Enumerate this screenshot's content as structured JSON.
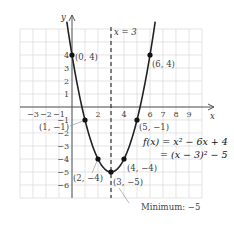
{
  "chart_data": {
    "type": "line",
    "title": "",
    "xlabel": "x",
    "ylabel": "y",
    "xlim": [
      -4,
      10
    ],
    "ylim": [
      -7,
      6
    ],
    "grid": true,
    "x_ticks": [
      -3,
      -2,
      -1,
      2,
      4,
      6,
      7,
      8,
      9
    ],
    "y_ticks": [
      4,
      3,
      2,
      1,
      -1,
      -2,
      -3,
      -4,
      -5,
      -6
    ],
    "series": [
      {
        "name": "f(x) = x^2 - 6x + 4",
        "function": "x^2 - 6x + 4",
        "domain": [
          -0.4,
          6.4
        ]
      }
    ],
    "points": [
      {
        "x": 0,
        "y": 4,
        "label": "(0, 4)"
      },
      {
        "x": 6,
        "y": 4,
        "label": "(6, 4)"
      },
      {
        "x": 1,
        "y": -1,
        "label": "(1, −1)"
      },
      {
        "x": 5,
        "y": -1,
        "label": "(5, −1)"
      },
      {
        "x": 2,
        "y": -4,
        "label": "(2, −4)"
      },
      {
        "x": 4,
        "y": -4,
        "label": "(4, −4)"
      },
      {
        "x": 3,
        "y": -5,
        "label": "(3, −5)"
      }
    ],
    "axis_of_symmetry": {
      "x": 3,
      "label": "x = 3"
    },
    "equation_lines": [
      "f(x) = x² − 6x + 4",
      "= (x − 3)² − 5"
    ],
    "annotation": "Minimum: −5"
  },
  "colors": {
    "curve": "#222222",
    "grid": "#d9d9d9",
    "axis": "#555555"
  }
}
